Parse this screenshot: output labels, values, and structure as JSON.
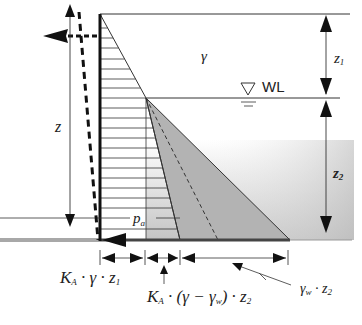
{
  "diagram": {
    "labels": {
      "gamma": "γ",
      "water_level": "WL",
      "z": "z",
      "z1_main": "z",
      "z1_sub": "1",
      "z2_main": "z",
      "z2_sub": "2",
      "pa_main": "p",
      "pa_sub": "a",
      "dim1_text": "K",
      "dim1_sub": "A",
      "dim1_rest": " · γ · z",
      "dim1_sub2": "1",
      "dim2_text": "K",
      "dim2_sub": "A",
      "dim2_rest": " · (γ − γ",
      "dim2_sub2": "w",
      "dim2_rest2": ") · z",
      "dim2_sub3": "2",
      "dim3_text": "γ",
      "dim3_sub": "w",
      "dim3_rest": " · z",
      "dim3_sub2": "2"
    },
    "colors": {
      "line": "#222222",
      "shaded_triangle": "#b0b0b0",
      "ground": "#a8a8a8",
      "soil_gradient_start": "#ffffff",
      "soil_gradient_end": "#c8c8c8"
    }
  }
}
